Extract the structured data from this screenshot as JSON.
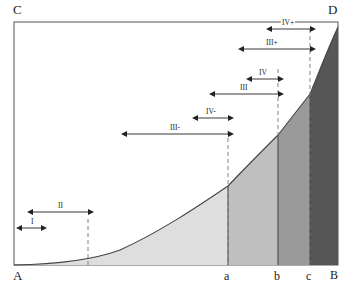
{
  "figure": {
    "background_color": "#ffffff",
    "plot_box": {
      "left": 14,
      "top": 22,
      "right": 338,
      "bottom": 265,
      "border_color": "#555555"
    },
    "corner_labels": [
      {
        "name": "C",
        "text": "C",
        "x": 14,
        "y": 4
      },
      {
        "name": "D",
        "text": "D",
        "x": 329,
        "y": 4
      },
      {
        "name": "A",
        "text": "A",
        "x": 14,
        "y": 270
      },
      {
        "name": "B",
        "text": "B",
        "x": 331,
        "y": 270
      }
    ],
    "axis_tick_labels": [
      {
        "name": "a",
        "text": "a",
        "x": 225,
        "y": 271
      },
      {
        "name": "b",
        "text": "b",
        "x": 275,
        "y": 271
      },
      {
        "name": "c",
        "text": "c",
        "x": 307,
        "y": 271
      },
      {
        "name": "B",
        "text": "B",
        "x": 331,
        "y": 271
      }
    ],
    "curve": {
      "stroke_color": "#444444",
      "stroke_width": 1.1,
      "description": "exponential curve rising from A at bottom-left to D at top-right"
    },
    "dashed_guides": [
      {
        "name": "guide-at-II-end",
        "x": 88,
        "y_top": 219,
        "y_bottom": 265
      },
      {
        "name": "guide-at-a",
        "x": 228,
        "y_top": 131,
        "y_bottom": 265
      },
      {
        "name": "guide-at-b",
        "x": 278,
        "y_top": 69,
        "y_bottom": 265
      },
      {
        "name": "guide-at-c",
        "x": 310,
        "y_top": 29,
        "y_bottom": 265
      }
    ],
    "bands": [
      {
        "name": "band-A-to-a",
        "from": "A",
        "to": "a",
        "x_start": 14,
        "x_end": 228,
        "fill": "#dedede"
      },
      {
        "name": "band-a-to-b",
        "from": "a",
        "to": "b",
        "x_start": 228,
        "x_end": 278,
        "fill": "#bfbfbf"
      },
      {
        "name": "band-b-to-c",
        "from": "b",
        "to": "c",
        "x_start": 278,
        "x_end": 310,
        "fill": "#9a9a9a"
      },
      {
        "name": "band-c-to-B",
        "from": "c",
        "to": "B",
        "x_start": 310,
        "x_end": 338,
        "fill": "#565656"
      }
    ],
    "span_arrows": [
      {
        "name": "span-IV-plus",
        "label": "IV+",
        "x_start": 272,
        "x_end": 310,
        "y": 29,
        "label_x": 284,
        "label_y": 22
      },
      {
        "name": "span-III-plus",
        "label": "III+",
        "x_start": 244,
        "x_end": 310,
        "y": 49,
        "label_x": 268,
        "label_y": 42
      },
      {
        "name": "span-IV",
        "label": "IV",
        "x_start": 252,
        "x_end": 278,
        "y": 79,
        "label_x": 259,
        "label_y": 71
      },
      {
        "name": "span-III",
        "label": "III",
        "x_start": 215,
        "x_end": 278,
        "y": 94,
        "label_x": 240,
        "label_y": 87
      },
      {
        "name": "span-IV-minus",
        "label": "IV-",
        "x_start": 198,
        "x_end": 228,
        "y": 118,
        "label_x": 206,
        "label_y": 111
      },
      {
        "name": "span-III-minus",
        "label": "III-",
        "x_start": 127,
        "x_end": 228,
        "y": 134,
        "label_x": 170,
        "label_y": 127
      },
      {
        "name": "span-II",
        "label": "II",
        "x_start": 33,
        "x_end": 88,
        "y": 212,
        "label_x": 57,
        "label_y": 204
      },
      {
        "name": "span-I",
        "label": "I",
        "x_start": 22,
        "x_end": 41,
        "y": 228,
        "label_x": 29,
        "label_y": 220
      }
    ],
    "arrow_style": {
      "stroke_color": "#222222",
      "stroke_width": 0.9
    }
  }
}
